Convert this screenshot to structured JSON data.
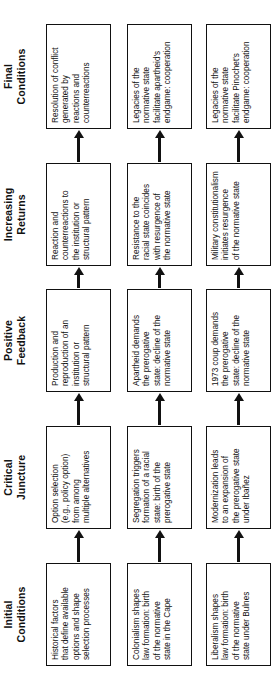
{
  "figure": {
    "orientation": "rotated-90-ccw",
    "stages": [
      {
        "id": "initial-conditions",
        "line1": "Initial",
        "line2": "Conditions"
      },
      {
        "id": "critical-juncture",
        "line1": "Critical",
        "line2": "Juncture"
      },
      {
        "id": "positive-feedback",
        "line1": "Positive",
        "line2": "Feedback"
      },
      {
        "id": "increasing-returns",
        "line1": "Increasing",
        "line2": "Returns"
      },
      {
        "id": "final-conditions",
        "line1": "Final",
        "line2": "Conditions"
      }
    ],
    "rows": [
      {
        "id": "generic",
        "nodes": [
          "Historical factors\nthat define available\noptions and shape\nselection processes",
          "Option selection\n(e.g., policy option)\nfrom among\nmultiple alternatives",
          "Production and\nreproduction of an\ninstitution or\nstructural pattern",
          "Reaction and\ncounterreactions to\nthe institution or\nstructural pattern",
          "Resolution of conflict\ngenerated by\nreactions and\ncounterreactions"
        ]
      },
      {
        "id": "south-africa",
        "nodes": [
          "Colonialism shapes\nlaw formation: birth\nof the normative\nstate in the Cape",
          "Segregation triggers\nformation of a racial\nstate: birth of the\nprerogative state",
          "Apartheid demands\nthe prerogative\nstate: decline of the\nnormative state",
          "Resistance to the\nracial state coincides\nwith resurgence of\nthe normative state",
          "Legacies of the\nnormative state\nfacilitate apartheid's\nendgame: cooperation"
        ]
      },
      {
        "id": "chile",
        "nodes": [
          "Liberalism shapes\nlaw formation: birth\nof the normative\nstate under Bulnes",
          "Modernization leads\nto an expansion of\nthe prerogative state\nunder Ibañez",
          "1973 coup demands\nthe prerogative\nstate: decline of the\nnormative state",
          "Military constitutionalism\ninitiates resurgence\nof the normative state",
          "Legacies of the\nnormative state\nfacilitate Pinochet's\nendgame: cooperation"
        ]
      }
    ],
    "colors": {
      "background": "#ffffff",
      "box_border": "#111111",
      "text": "#111111",
      "arrow": "#111111"
    }
  }
}
